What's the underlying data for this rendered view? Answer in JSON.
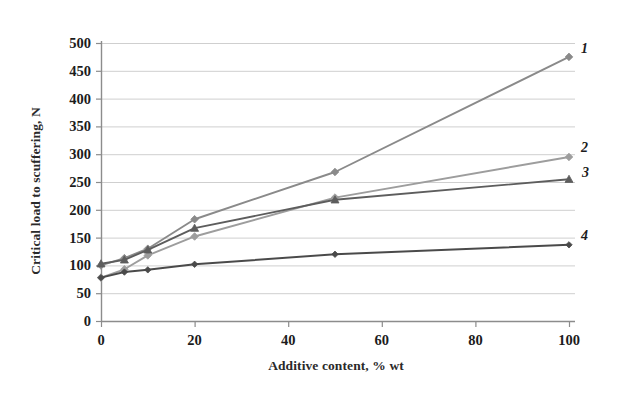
{
  "chart_data": {
    "type": "line",
    "title": "",
    "xlabel": "Additive content, % wt",
    "ylabel": "Critical load to scuffering, N",
    "xlim": [
      0,
      100
    ],
    "ylim": [
      0,
      500
    ],
    "xticks": [
      "0",
      "20",
      "40",
      "60",
      "80",
      "100"
    ],
    "xtick_values": [
      0,
      20,
      40,
      60,
      80,
      100
    ],
    "yticks": [
      "0",
      "50",
      "100",
      "150",
      "200",
      "250",
      "300",
      "350",
      "400",
      "450",
      "500"
    ],
    "ytick_values": [
      0,
      50,
      100,
      150,
      200,
      250,
      300,
      350,
      400,
      450,
      500
    ],
    "grid": "horizontal",
    "legend": "none",
    "annotations": [
      "1",
      "2",
      "3",
      "4"
    ],
    "x": [
      0,
      5,
      10,
      20,
      50,
      100
    ],
    "series": [
      {
        "name": "1",
        "label": "1",
        "color": "#8a8a8a",
        "marker": "diamond",
        "values": [
          100,
          113,
          130,
          183,
          268,
          475
        ]
      },
      {
        "name": "2",
        "label": "2",
        "color": "#9d9d9d",
        "marker": "diamond",
        "values": [
          78,
          93,
          118,
          152,
          222,
          295
        ]
      },
      {
        "name": "3",
        "label": "3",
        "color": "#5d5d5d",
        "marker": "triangle",
        "values": [
          103,
          110,
          128,
          167,
          218,
          255
        ]
      },
      {
        "name": "4",
        "label": "4",
        "color": "#4a4a4a",
        "marker": "diamond",
        "values": [
          78,
          88,
          92,
          102,
          120,
          137
        ]
      }
    ]
  },
  "axes": {
    "axis_color": "#8c8c8c",
    "grid_color": "#cfcfcf",
    "tick_text_color": "#1c1c1c"
  }
}
